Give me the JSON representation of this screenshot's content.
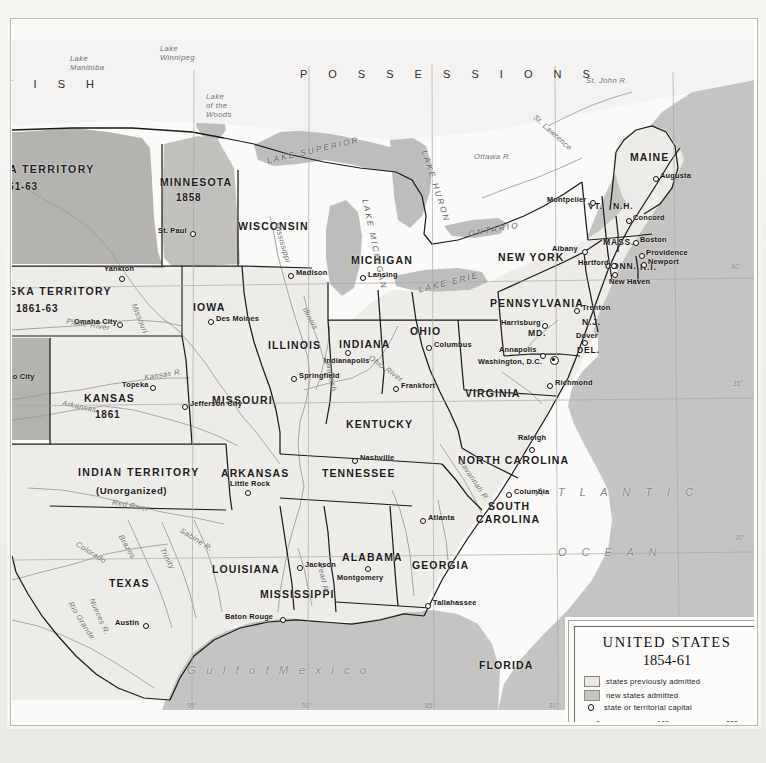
{
  "legend": {
    "title": "UNITED STATES",
    "years": "1854-61",
    "entries": [
      {
        "swatch": "prev",
        "label": "states previously admitted"
      },
      {
        "swatch": "new",
        "label": "new states admitted"
      },
      {
        "swatch": "ring",
        "label": "state or territorial capital"
      }
    ],
    "scale": {
      "start": "0",
      "mid": "100",
      "end": "200"
    }
  },
  "regions": {
    "british": "T I S H",
    "possessions": "P O S S E S S I O N S",
    "atlantic_line1": "A T L A N T I C",
    "atlantic_line2": "O C E A N",
    "gulf": "G u l f   o f   M e x i c o"
  },
  "territories": [
    {
      "name": "TA TERRITORY",
      "year": "861-63",
      "x": 0,
      "y": 160
    },
    {
      "name": "ASKA   TERRITORY",
      "year": "1861-63",
      "x": 0,
      "y": 277
    },
    {
      "name": "INDIAN TERRITORY",
      "year": "(Unorganized)",
      "x": 68,
      "y": 453
    }
  ],
  "states": [
    {
      "label": "MINNESOTA",
      "year": "1858",
      "x": 150,
      "y": 164,
      "cls": "state"
    },
    {
      "label": "WISCONSIN",
      "x": 228,
      "y": 205,
      "cls": "state"
    },
    {
      "label": "MICHIGAN",
      "x": 341,
      "y": 240,
      "cls": "state"
    },
    {
      "label": "IOWA",
      "x": 183,
      "y": 287,
      "cls": "state"
    },
    {
      "label": "ILLINOIS",
      "x": 260,
      "y": 325,
      "cls": "state"
    },
    {
      "label": "INDIANA",
      "x": 331,
      "y": 324,
      "cls": "state"
    },
    {
      "label": "OHIO",
      "x": 401,
      "y": 311,
      "cls": "state"
    },
    {
      "label": "MISSOURI",
      "x": 203,
      "y": 380,
      "cls": "state"
    },
    {
      "label": "KENTUCKY",
      "x": 337,
      "y": 404,
      "cls": "state"
    },
    {
      "label": "TENNESSEE",
      "x": 313,
      "y": 453,
      "cls": "state"
    },
    {
      "label": "ARKANSAS",
      "x": 211,
      "y": 453,
      "cls": "state"
    },
    {
      "label": "LOUISIANA",
      "x": 203,
      "y": 549,
      "cls": "state"
    },
    {
      "label": "MISSISSIPPI",
      "x": 251,
      "y": 574,
      "cls": "state"
    },
    {
      "label": "ALABAMA",
      "x": 333,
      "y": 537,
      "cls": "state"
    },
    {
      "label": "GEORGIA",
      "x": 403,
      "y": 545,
      "cls": "state"
    },
    {
      "label": "FLORIDA",
      "x": 470,
      "y": 645,
      "cls": "state"
    },
    {
      "label": "SOUTH",
      "x": 478,
      "y": 486,
      "cls": "state"
    },
    {
      "label": "CAROLINA",
      "x": 466,
      "y": 499,
      "cls": "state"
    },
    {
      "label": "NORTH CAROLINA",
      "x": 449,
      "y": 440,
      "cls": "state"
    },
    {
      "label": "VIRGINIA",
      "x": 456,
      "y": 373,
      "cls": "state"
    },
    {
      "label": "PENNSYLVANIA",
      "x": 481,
      "y": 283,
      "cls": "state"
    },
    {
      "label": "NEW YORK",
      "x": 489,
      "y": 237,
      "cls": "state"
    },
    {
      "label": "MAINE",
      "x": 621,
      "y": 137,
      "cls": "state"
    },
    {
      "label": "TEXAS",
      "x": 100,
      "y": 563,
      "cls": "state"
    },
    {
      "label": "KANSAS",
      "year": "1861",
      "x": 74,
      "y": 379,
      "cls": "state"
    },
    {
      "label": "VT.",
      "x": 579,
      "y": 186,
      "cls": "state sm"
    },
    {
      "label": "N.H.",
      "x": 604,
      "y": 186,
      "cls": "state sm"
    },
    {
      "label": "MASS.",
      "x": 594,
      "y": 222,
      "cls": "state sm"
    },
    {
      "label": "CONN.",
      "x": 596,
      "y": 246,
      "cls": "state sm"
    },
    {
      "label": "R.I.",
      "x": 630,
      "y": 247,
      "cls": "state sm"
    },
    {
      "label": "N.J.",
      "x": 573,
      "y": 302,
      "cls": "state sm"
    },
    {
      "label": "DEL.",
      "x": 568,
      "y": 330,
      "cls": "state sm"
    },
    {
      "label": "MD.",
      "x": 519,
      "y": 313,
      "cls": "state sm"
    }
  ],
  "cities": [
    {
      "name": "St. Paul",
      "x": 178,
      "y": 211,
      "dx": 28,
      "dy": -1,
      "side": "left"
    },
    {
      "name": "Madison",
      "x": 276,
      "y": 253,
      "dx": 7,
      "dy": -1,
      "side": "right"
    },
    {
      "name": "Lansing",
      "x": 348,
      "y": 255,
      "dx": 7,
      "dy": -1,
      "side": "right"
    },
    {
      "name": "Des Moines",
      "x": 196,
      "y": 299,
      "dx": 7,
      "dy": -1,
      "side": "right"
    },
    {
      "name": "Springfield",
      "x": 279,
      "y": 356,
      "dx": 7,
      "dy": -1,
      "side": "right"
    },
    {
      "name": "Indianapolis",
      "x": 333,
      "y": 336,
      "dx": 0,
      "dy": 4,
      "side": "below"
    },
    {
      "name": "Columbus",
      "x": 414,
      "y": 325,
      "dx": 7,
      "dy": -1,
      "side": "right"
    },
    {
      "name": "Frankfort",
      "x": 381,
      "y": 366,
      "dx": 7,
      "dy": -1,
      "side": "right"
    },
    {
      "name": "Jefferson City",
      "x": 170,
      "y": 384,
      "dx": 7,
      "dy": -1,
      "side": "right"
    },
    {
      "name": "Topeka",
      "x": 138,
      "y": 365,
      "dx": -6,
      "dy": -1,
      "side": "left"
    },
    {
      "name": "Omaha City",
      "x": 105,
      "y": 302,
      "dx": -6,
      "dy": -1,
      "side": "left"
    },
    {
      "name": "Yankton",
      "x": 107,
      "y": 256,
      "dx": 0,
      "dy": -10,
      "side": "above"
    },
    {
      "name": "do City",
      "x": 0,
      "y": 357,
      "dx": 0,
      "dy": 0,
      "side": "none"
    },
    {
      "name": "Little Rock",
      "x": 233,
      "y": 470,
      "dx": 0,
      "dy": -10,
      "side": "above"
    },
    {
      "name": "Nashville",
      "x": 340,
      "y": 438,
      "dx": 7,
      "dy": -1,
      "side": "right"
    },
    {
      "name": "Jackson",
      "x": 285,
      "y": 545,
      "dx": 7,
      "dy": -1,
      "side": "right"
    },
    {
      "name": "Montgomery",
      "x": 353,
      "y": 552,
      "dx": 0,
      "dy": 4,
      "side": "below"
    },
    {
      "name": "Baton Rouge",
      "x": 268,
      "y": 597,
      "dx": -6,
      "dy": -1,
      "side": "left"
    },
    {
      "name": "Tallahassee",
      "x": 413,
      "y": 583,
      "dx": 7,
      "dy": -1,
      "side": "right"
    },
    {
      "name": "Atlanta",
      "x": 408,
      "y": 498,
      "dx": 7,
      "dy": -1,
      "side": "right"
    },
    {
      "name": "Columbia",
      "x": 494,
      "y": 472,
      "dx": 7,
      "dy": -1,
      "side": "right"
    },
    {
      "name": "Raleigh",
      "x": 517,
      "y": 421,
      "dx": 0,
      "dy": -10,
      "side": "above"
    },
    {
      "name": "Richmond",
      "x": 535,
      "y": 363,
      "dx": 7,
      "dy": -1,
      "side": "right"
    },
    {
      "name": "Washington, D.C.",
      "x": 533,
      "y": 341,
      "dx": -6,
      "dy": -1,
      "side": "left"
    },
    {
      "name": "Annapolis",
      "x": 528,
      "y": 333,
      "dx": -6,
      "dy": -1,
      "side": "left"
    },
    {
      "name": "Dover",
      "x": 570,
      "y": 320,
      "dx": -6,
      "dy": -1,
      "side": "left"
    },
    {
      "name": "Trenton",
      "x": 570,
      "y": 288,
      "dx": 6,
      "dy": -1,
      "side": "right"
    },
    {
      "name": "Harrisburg",
      "x": 528,
      "y": 303,
      "dx": -6,
      "dy": -1,
      "side": "left"
    },
    {
      "name": "Albany",
      "x": 568,
      "y": 229,
      "dx": -6,
      "dy": -1,
      "side": "left"
    },
    {
      "name": "Hartford",
      "x": 597,
      "y": 243,
      "dx": -6,
      "dy": -1,
      "side": "left"
    },
    {
      "name": "New Haven",
      "x": 600,
      "y": 256,
      "dx": 0,
      "dy": 4,
      "side": "below"
    },
    {
      "name": "Providence",
      "x": 631,
      "y": 233,
      "dx": 5,
      "dy": -1,
      "side": "right"
    },
    {
      "name": "Newport",
      "x": 633,
      "y": 242,
      "dx": 5,
      "dy": -1,
      "side": "right"
    },
    {
      "name": "Boston",
      "x": 626,
      "y": 220,
      "dx": 5,
      "dy": -1,
      "side": "right"
    },
    {
      "name": "Concord",
      "x": 619,
      "y": 198,
      "dx": 5,
      "dy": -1,
      "side": "right"
    },
    {
      "name": "Montpelier",
      "x": 578,
      "y": 180,
      "dx": -6,
      "dy": -1,
      "side": "left"
    },
    {
      "name": "Augusta",
      "x": 645,
      "y": 156,
      "dx": 5,
      "dy": -1,
      "side": "right"
    },
    {
      "name": "Austin",
      "x": 129,
      "y": 603,
      "dx": -6,
      "dy": -1,
      "side": "left"
    }
  ],
  "capital_special": {
    "name": "Washington, D.C.",
    "x": 540,
    "y": 338
  },
  "waters": [
    {
      "name": "Lake\nManitoba",
      "x": 62,
      "y": 41,
      "cls": "water"
    },
    {
      "name": "Lake\nWinnipeg",
      "x": 152,
      "y": 30,
      "cls": "water"
    },
    {
      "name": "Lake\nof the\nWoods",
      "x": 198,
      "y": 80,
      "cls": "water"
    },
    {
      "name": "St. John R.",
      "x": 578,
      "y": 62,
      "cls": "water"
    },
    {
      "name": "Ottawa  R.",
      "x": 468,
      "y": 139,
      "cls": "water"
    },
    {
      "name": "Mississippi",
      "x": 255,
      "y": 225,
      "cls": "water"
    },
    {
      "name": "Missouri",
      "x": 118,
      "y": 300,
      "cls": "water"
    },
    {
      "name": "Platte  River",
      "x": 60,
      "y": 305,
      "cls": "water"
    },
    {
      "name": "Kansas  R.",
      "x": 137,
      "y": 356,
      "cls": "water"
    },
    {
      "name": "Arkansas",
      "x": 55,
      "y": 388,
      "cls": "water"
    },
    {
      "name": "Red    River",
      "x": 105,
      "y": 487,
      "cls": "water"
    },
    {
      "name": "Colorado",
      "x": 68,
      "y": 534,
      "cls": "water"
    },
    {
      "name": "Brazos",
      "x": 106,
      "y": 528,
      "cls": "water"
    },
    {
      "name": "Trinity",
      "x": 148,
      "y": 540,
      "cls": "water"
    },
    {
      "name": "Sabine R.",
      "x": 170,
      "y": 521,
      "cls": "water"
    },
    {
      "name": "Rio Grande",
      "x": 54,
      "y": 602,
      "cls": "water"
    },
    {
      "name": "Nueces  R.",
      "x": 72,
      "y": 598,
      "cls": "water"
    },
    {
      "name": "Ohio  River",
      "x": 360,
      "y": 350,
      "cls": "water"
    },
    {
      "name": "Wabash",
      "x": 308,
      "y": 358,
      "cls": "water"
    },
    {
      "name": "Illinois",
      "x": 290,
      "y": 300,
      "cls": "water"
    },
    {
      "name": "Savannah R.",
      "x": 444,
      "y": 462,
      "cls": "water"
    },
    {
      "name": "Pearl R.",
      "x": 300,
      "y": 560,
      "cls": "water"
    },
    {
      "name": "St. Lawrence",
      "x": 523,
      "y": 115,
      "cls": "water"
    }
  ],
  "lakes": [
    {
      "name": "LAKE  SUPERIOR",
      "x": 262,
      "y": 133,
      "rot": -13
    },
    {
      "name": "LAKE  HURON",
      "x": 392,
      "y": 168,
      "rot": 72
    },
    {
      "name": "LAKE  MICHIGAN",
      "x": 322,
      "y": 226,
      "rot": 78
    },
    {
      "name": "LAKE  ERIE",
      "x": 413,
      "y": 265,
      "rot": -14
    },
    {
      "name": "ONTARIO",
      "x": 463,
      "y": 211,
      "rot": -10
    }
  ],
  "graticule": {
    "longitude": [
      {
        "label": "95°",
        "x": 182
      },
      {
        "label": "90°",
        "x": 297
      },
      {
        "label": "85°",
        "x": 420
      },
      {
        "label": "80°",
        "x": 543
      },
      {
        "label": "75°",
        "x": 661
      }
    ],
    "latitude": [
      {
        "label": "40°",
        "y": 266
      },
      {
        "label": "35°",
        "y": 383
      },
      {
        "label": "30°",
        "y": 537
      }
    ]
  },
  "colors": {
    "territory_gray": "#b4b3b0",
    "new_state": "#c7c5c0",
    "previous_state": "#eeece8",
    "water": "#bdbdbb",
    "ocean": "#c5c4c2",
    "border": "#1a1a1a"
  }
}
